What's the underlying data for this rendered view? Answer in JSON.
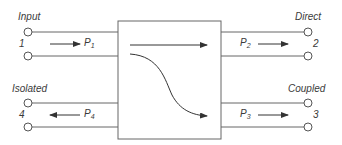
{
  "diagram": {
    "type": "directional-coupler",
    "colors": {
      "line": "#555555",
      "text": "#3a3a3a",
      "background": "#ffffff"
    },
    "ports": [
      {
        "id": "port-1",
        "name": "Input",
        "number": "1",
        "power_label": "P",
        "power_sub": "1",
        "flow": "into-coupler",
        "side": "left-top"
      },
      {
        "id": "port-2",
        "name": "Direct",
        "number": "2",
        "power_label": "P",
        "power_sub": "2",
        "flow": "out-of-coupler",
        "side": "right-top"
      },
      {
        "id": "port-3",
        "name": "Coupled",
        "number": "3",
        "power_label": "P",
        "power_sub": "3",
        "flow": "out-of-coupler",
        "side": "right-bottom"
      },
      {
        "id": "port-4",
        "name": "Isolated",
        "number": "4",
        "power_label": "P",
        "power_sub": "4",
        "flow": "out-of-coupler",
        "side": "left-bottom"
      }
    ],
    "internal_paths": [
      {
        "from": "port-1",
        "to": "port-2",
        "shape": "straight-arrow"
      },
      {
        "from": "port-1",
        "to": "port-3",
        "shape": "curved-arrow"
      }
    ]
  }
}
